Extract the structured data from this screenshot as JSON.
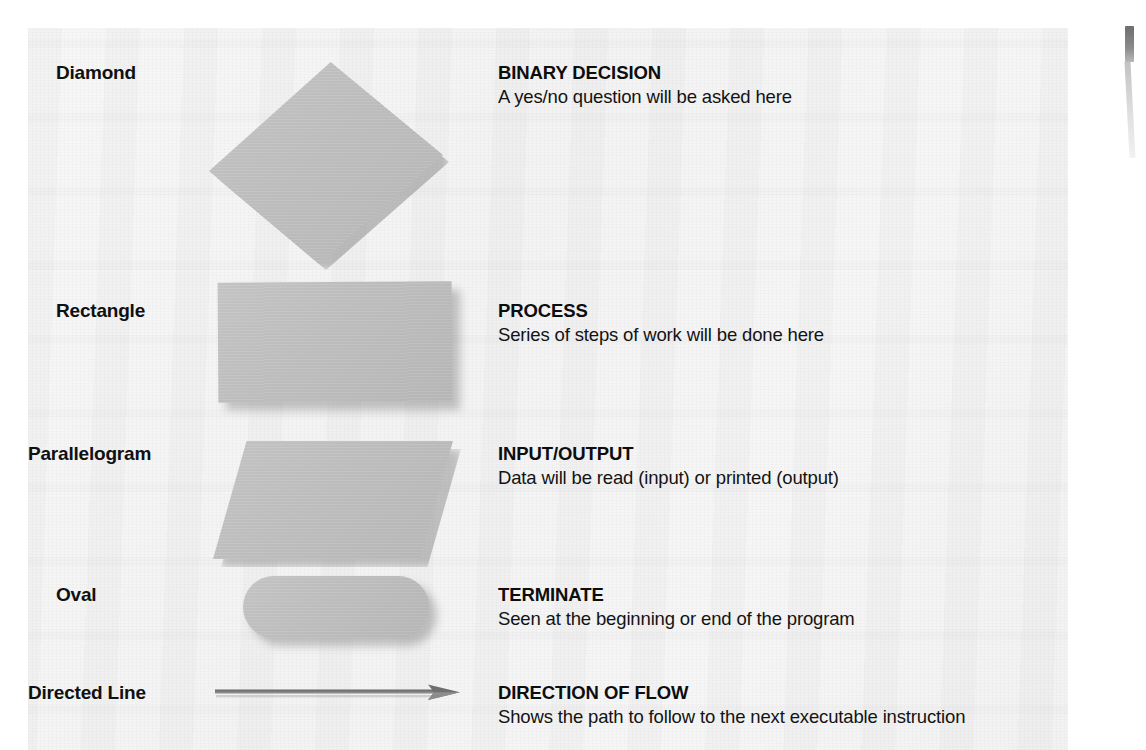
{
  "legend": {
    "rows": [
      {
        "shape_name": "Diamond",
        "shape_icon": "diamond-shape",
        "title": "BINARY DECISION",
        "description": "A yes/no question will be asked here"
      },
      {
        "shape_name": "Rectangle",
        "shape_icon": "rectangle-shape",
        "title": "PROCESS",
        "description": "Series of steps of work will be done here"
      },
      {
        "shape_name": "Parallelogram",
        "shape_icon": "parallelogram-shape",
        "title": "INPUT/OUTPUT",
        "description": "Data will be read (input) or printed (output)"
      },
      {
        "shape_name": "Oval",
        "shape_icon": "oval-shape",
        "title": "TERMINATE",
        "description": "Seen at the beginning or end of the program"
      },
      {
        "shape_name": "Directed Line",
        "shape_icon": "arrow-right-icon",
        "title": "DIRECTION OF FLOW",
        "description": "Shows the path to follow to the next executable instruction"
      }
    ]
  },
  "colors": {
    "page_background": "#f4f4f4",
    "shape_fill": "#bcbcbc",
    "shape_shadow": "#787878",
    "text": "#101010",
    "arrow": "#6b6b6b",
    "edge_tab": "#6e6e6e"
  }
}
